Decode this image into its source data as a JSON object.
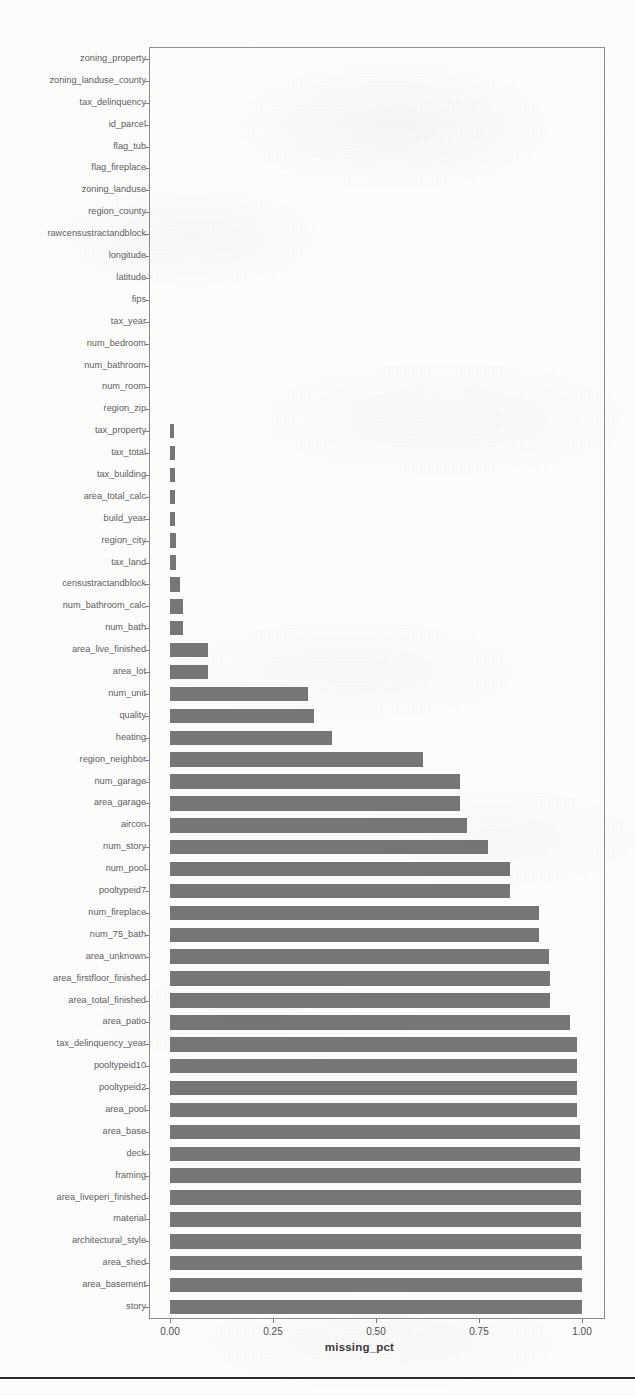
{
  "chart_data": {
    "type": "bar",
    "orientation": "horizontal",
    "title": "",
    "xlabel": "missing_pct",
    "ylabel": "",
    "xlim": [
      0.0,
      1.0
    ],
    "xticks": [
      "0.00",
      "0.25",
      "0.50",
      "0.75",
      "1.00"
    ],
    "xtick_values": [
      0.0,
      0.25,
      0.5,
      0.75,
      1.0
    ],
    "grid": false,
    "legend": null,
    "bar_color": "#767676",
    "axis_color": "#8e8e8e",
    "categories": [
      "zoning_property",
      "zoning_landuse_county",
      "tax_delinquency",
      "id_parcel",
      "flag_tub",
      "flag_fireplace",
      "zoning_landuse",
      "region_county",
      "rawcensustractandblock",
      "longitude",
      "latitude",
      "fips",
      "tax_year",
      "num_bedroom",
      "num_bathroom",
      "num_room",
      "region_zip",
      "tax_property",
      "tax_total",
      "tax_building",
      "area_total_calc",
      "build_year",
      "region_city",
      "tax_land",
      "censustractandblock",
      "num_bathroom_calc",
      "num_bath",
      "area_live_finished",
      "area_lot",
      "num_unit",
      "quality",
      "heating",
      "region_neighbor",
      "num_garage",
      "area_garage",
      "aircon",
      "num_story",
      "num_pool",
      "pooltypeid7",
      "num_fireplace",
      "num_75_bath",
      "area_unknown",
      "area_firstfloor_finished",
      "area_total_finished",
      "area_patio",
      "tax_delinquency_year",
      "pooltypeid10",
      "pooltypeid2",
      "area_pool",
      "area_base",
      "deck",
      "framing",
      "area_liveperi_finished",
      "material",
      "architectural_style",
      "area_shed",
      "area_basement",
      "story"
    ],
    "values": [
      0.0,
      0.0,
      0.0,
      0.0,
      0.0,
      0.0,
      0.0004,
      0.0004,
      0.0004,
      0.0004,
      0.0004,
      0.0004,
      0.0004,
      0.0005,
      0.0005,
      0.0006,
      0.0007,
      0.01,
      0.011,
      0.012,
      0.013,
      0.013,
      0.014,
      0.015,
      0.025,
      0.031,
      0.031,
      0.093,
      0.093,
      0.336,
      0.35,
      0.394,
      0.613,
      0.704,
      0.704,
      0.721,
      0.772,
      0.826,
      0.826,
      0.895,
      0.896,
      0.919,
      0.922,
      0.923,
      0.972,
      0.989,
      0.989,
      0.989,
      0.989,
      0.995,
      0.995,
      0.997,
      0.997,
      0.997,
      0.998,
      0.999,
      0.999,
      1.0
    ]
  },
  "figure": {
    "x_axis_title": "missing_pct"
  }
}
